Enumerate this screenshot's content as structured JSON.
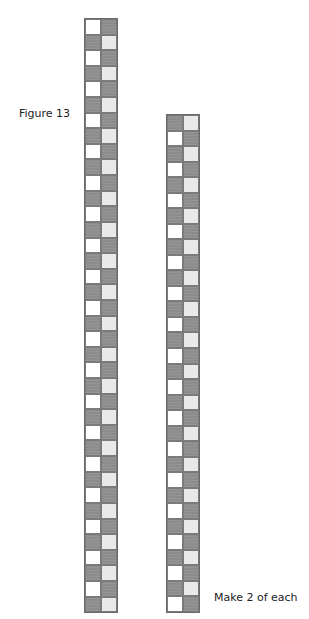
{
  "figure": {
    "title": "Figure 13",
    "note": "Make 2 of each"
  },
  "colors": {
    "white": "#ffffff",
    "dark": "#8c8c8c",
    "light": "#e9e9e9",
    "border": "#6a6a6a"
  },
  "strips": [
    {
      "name": "left-strip",
      "rows": 38,
      "columns": 2,
      "pattern": [
        [
          "white",
          "dark"
        ],
        [
          "dark",
          "light"
        ]
      ]
    },
    {
      "name": "right-strip",
      "rows": 32,
      "columns": 2,
      "pattern": [
        [
          "dark",
          "light"
        ],
        [
          "white",
          "dark"
        ]
      ]
    }
  ]
}
